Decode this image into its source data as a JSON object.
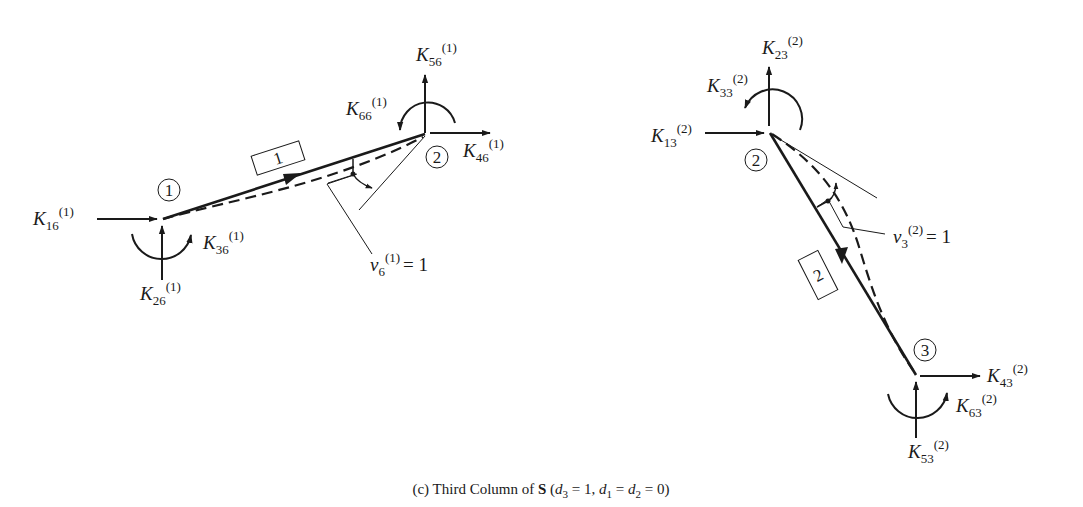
{
  "caption": {
    "prefix": "(c) Third Column of ",
    "matrix": "S",
    "condition_open": " (",
    "d3": "d",
    "d3_sub": "3",
    "d3_eq": " = 1, ",
    "d1": "d",
    "d1_sub": "1",
    "d1_eq": " = ",
    "d2": "d",
    "d2_sub": "2",
    "d2_eq": " = 0)"
  },
  "member1": {
    "label": "1",
    "start_node": "1",
    "end_node": "2",
    "deformation": {
      "symbol": "v",
      "sub": "6",
      "sup": "(1)",
      "value": "= 1"
    },
    "forces": [
      {
        "id": "K16",
        "symbol": "K",
        "sub": "16",
        "sup": "(1)"
      },
      {
        "id": "K26",
        "symbol": "K",
        "sub": "26",
        "sup": "(1)"
      },
      {
        "id": "K36",
        "symbol": "K",
        "sub": "36",
        "sup": "(1)"
      },
      {
        "id": "K46",
        "symbol": "K",
        "sub": "46",
        "sup": "(1)"
      },
      {
        "id": "K56",
        "symbol": "K",
        "sub": "56",
        "sup": "(1)"
      },
      {
        "id": "K66",
        "symbol": "K",
        "sub": "66",
        "sup": "(1)"
      }
    ]
  },
  "member2": {
    "label": "2",
    "start_node": "2",
    "end_node": "3",
    "deformation": {
      "symbol": "v",
      "sub": "3",
      "sup": "(2)",
      "value": "= 1"
    },
    "forces": [
      {
        "id": "K13",
        "symbol": "K",
        "sub": "13",
        "sup": "(2)"
      },
      {
        "id": "K23",
        "symbol": "K",
        "sub": "23",
        "sup": "(2)"
      },
      {
        "id": "K33",
        "symbol": "K",
        "sub": "33",
        "sup": "(2)"
      },
      {
        "id": "K43",
        "symbol": "K",
        "sub": "43",
        "sup": "(2)"
      },
      {
        "id": "K53",
        "symbol": "K",
        "sub": "53",
        "sup": "(2)"
      },
      {
        "id": "K63",
        "symbol": "K",
        "sub": "63",
        "sup": "(2)"
      }
    ]
  },
  "colors": {
    "ink": "#1a1a1a",
    "background": "#ffffff"
  }
}
